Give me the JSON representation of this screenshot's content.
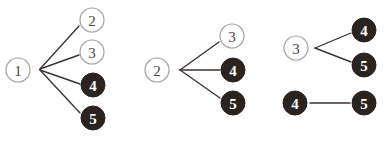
{
  "figure": {
    "width": 386,
    "height": 141,
    "background_color": "#ffffff",
    "styles": {
      "open_node_stroke": "#a6a2a0",
      "open_node_fill": "#ffffff",
      "open_node_text": "#4a4442",
      "filled_node_fill": "#2b2320",
      "filled_node_text": "#ffffff",
      "edge_color": "#3a3330"
    },
    "node_radius": 12
  },
  "chart_data": {
    "type": "diagram",
    "groups": [
      {
        "name": "group-1",
        "source": "1",
        "targets": [
          "2",
          "3",
          "4",
          "5"
        ]
      },
      {
        "name": "group-2",
        "source": "2",
        "targets": [
          "3",
          "4",
          "5"
        ]
      },
      {
        "name": "group-3",
        "source": "3",
        "targets": [
          "4",
          "5"
        ]
      },
      {
        "name": "group-4",
        "source": "4",
        "targets": [
          "5"
        ]
      }
    ]
  },
  "nodes": [
    {
      "id": "g1-src-1",
      "label": "1",
      "style": "open",
      "cx": 18,
      "cy": 70
    },
    {
      "id": "g1-tgt-2",
      "label": "2",
      "style": "open",
      "cx": 92,
      "cy": 20
    },
    {
      "id": "g1-tgt-3",
      "label": "3",
      "style": "open",
      "cx": 92,
      "cy": 52
    },
    {
      "id": "g1-tgt-4",
      "label": "4",
      "style": "filled",
      "cx": 93,
      "cy": 85
    },
    {
      "id": "g1-tgt-5",
      "label": "5",
      "style": "filled",
      "cx": 93,
      "cy": 118
    },
    {
      "id": "g2-src-2",
      "label": "2",
      "style": "open",
      "cx": 157,
      "cy": 70
    },
    {
      "id": "g2-tgt-3",
      "label": "3",
      "style": "open",
      "cx": 232,
      "cy": 36
    },
    {
      "id": "g2-tgt-4",
      "label": "4",
      "style": "filled",
      "cx": 233,
      "cy": 70
    },
    {
      "id": "g2-tgt-5",
      "label": "5",
      "style": "filled",
      "cx": 233,
      "cy": 103
    },
    {
      "id": "g3-src-3",
      "label": "3",
      "style": "open",
      "cx": 296,
      "cy": 48
    },
    {
      "id": "g3-tgt-4",
      "label": "4",
      "style": "filled",
      "cx": 364,
      "cy": 30
    },
    {
      "id": "g3-tgt-5",
      "label": "5",
      "style": "filled",
      "cx": 364,
      "cy": 65
    },
    {
      "id": "g4-src-4",
      "label": "4",
      "style": "filled",
      "cx": 295,
      "cy": 103
    },
    {
      "id": "g4-tgt-5",
      "label": "5",
      "style": "filled",
      "cx": 364,
      "cy": 103
    }
  ],
  "edges": [
    {
      "id": "e-1-2",
      "from": "g1-src-1",
      "to": "g1-tgt-2",
      "x1": 40,
      "y1": 69,
      "x2": 79,
      "y2": 26
    },
    {
      "id": "e-1-3",
      "from": "g1-src-1",
      "to": "g1-tgt-3",
      "x1": 40,
      "y1": 69,
      "x2": 79,
      "y2": 55
    },
    {
      "id": "e-1-4",
      "from": "g1-src-1",
      "to": "g1-tgt-4",
      "x1": 40,
      "y1": 70,
      "x2": 80,
      "y2": 84
    },
    {
      "id": "e-1-5",
      "from": "g1-src-1",
      "to": "g1-tgt-5",
      "x1": 40,
      "y1": 70,
      "x2": 80,
      "y2": 113
    },
    {
      "id": "e-2-3",
      "from": "g2-src-2",
      "to": "g2-tgt-3",
      "x1": 180,
      "y1": 70,
      "x2": 219,
      "y2": 42
    },
    {
      "id": "e-2-4",
      "from": "g2-src-2",
      "to": "g2-tgt-4",
      "x1": 180,
      "y1": 70,
      "x2": 220,
      "y2": 70
    },
    {
      "id": "e-2-5",
      "from": "g2-src-2",
      "to": "g2-tgt-5",
      "x1": 180,
      "y1": 70,
      "x2": 220,
      "y2": 98
    },
    {
      "id": "e-3-4",
      "from": "g3-src-3",
      "to": "g3-tgt-4",
      "x1": 315,
      "y1": 48,
      "x2": 351,
      "y2": 33
    },
    {
      "id": "e-3-5",
      "from": "g3-src-3",
      "to": "g3-tgt-5",
      "x1": 315,
      "y1": 48,
      "x2": 351,
      "y2": 62
    },
    {
      "id": "e-4-5",
      "from": "g4-src-4",
      "to": "g4-tgt-5",
      "x1": 310,
      "y1": 103,
      "x2": 350,
      "y2": 103
    }
  ]
}
